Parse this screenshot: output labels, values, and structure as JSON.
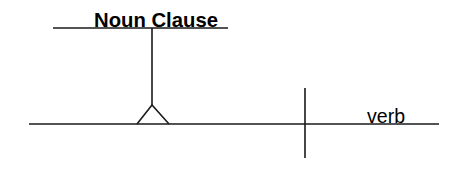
{
  "diagram": {
    "type": "sentence-diagram",
    "pedestal": {
      "label": "Noun Clause",
      "role": "noun clause on pedestal"
    },
    "baseline": {
      "predicate": {
        "label": "verb"
      },
      "divider": "subject-predicate divider"
    },
    "colors": {
      "line": "#1a1a1a",
      "text": "#000000",
      "background": "#ffffff"
    }
  }
}
